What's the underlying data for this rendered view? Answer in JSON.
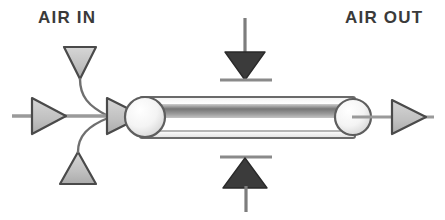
{
  "diagram": {
    "type": "schematic",
    "canvas": {
      "width": 445,
      "height": 220,
      "background": "#ffffff"
    },
    "labels": {
      "air_in": "AIR IN",
      "air_out": "AIR OUT"
    },
    "colors": {
      "outline": "#4a4a4a",
      "light_gray_fill": "#c9c9c9",
      "dark_fill": "#3b3b3b",
      "band_gray": "#8f8f8f",
      "body_fill": "#fdfdfd",
      "line_gray": "#8a8a8a",
      "text": "#3a3a3a"
    },
    "elements": [
      {
        "name": "air-in-top-arrow",
        "shape": "triangle",
        "direction": "down",
        "fill": "light_gray_fill",
        "role": "air inlet marker (upper)"
      },
      {
        "name": "air-in-bottom-arrow",
        "shape": "triangle",
        "direction": "up",
        "fill": "light_gray_fill",
        "role": "air inlet marker (lower)"
      },
      {
        "name": "air-in-top-curve",
        "shape": "curve",
        "role": "flow path from upper inlet to junction"
      },
      {
        "name": "air-in-bottom-curve",
        "shape": "curve",
        "role": "flow path from lower inlet to junction"
      },
      {
        "name": "inlet-flow-arrow",
        "shape": "triangle",
        "direction": "right",
        "fill": "light_gray_fill",
        "role": "main inbound flow"
      },
      {
        "name": "junction-arrow",
        "shape": "triangle",
        "direction": "right",
        "fill": "light_gray_fill",
        "role": "flow entering cylinder"
      },
      {
        "name": "cylinder-body",
        "shape": "cylinder",
        "role": "central tubular element"
      },
      {
        "name": "cylinder-left-cap",
        "shape": "circle",
        "role": "left end cap"
      },
      {
        "name": "cylinder-right-cap",
        "shape": "circle",
        "role": "right end cap"
      },
      {
        "name": "cylinder-band",
        "shape": "band",
        "role": "shaded interior band"
      },
      {
        "name": "top-pressure-arrow",
        "shape": "triangle",
        "direction": "down",
        "fill": "dark_fill",
        "role": "applied force / pressure from above"
      },
      {
        "name": "bottom-pressure-arrow",
        "shape": "triangle",
        "direction": "up",
        "fill": "dark_fill",
        "role": "applied force / pressure from below"
      },
      {
        "name": "outlet-flow-arrow",
        "shape": "triangle",
        "direction": "right",
        "fill": "light_gray_fill",
        "role": "air exiting"
      }
    ]
  }
}
